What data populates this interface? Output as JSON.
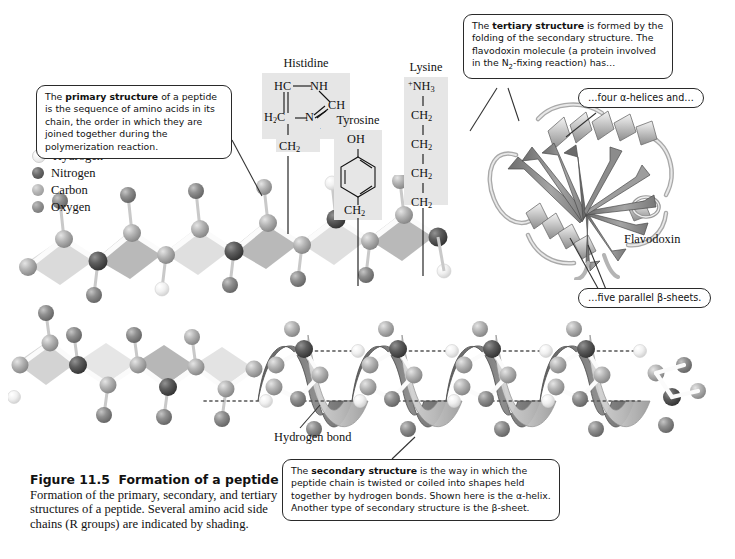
{
  "figure": {
    "number": "Figure 11.5",
    "title": "Formation of a peptide",
    "caption": "Formation of the primary, secondary, and tertiary structures of a peptide. Several amino acid side chains (R groups) are indicated by shading."
  },
  "legend": {
    "items": [
      {
        "label": "Hydrogen",
        "color": "#eeeeee",
        "key": "H"
      },
      {
        "label": "Nitrogen",
        "color": "#555555",
        "key": "N"
      },
      {
        "label": "Carbon",
        "color": "#b0b0b0",
        "key": "C"
      },
      {
        "label": "Oxygen",
        "color": "#8a8a8a",
        "key": "O"
      }
    ]
  },
  "callouts": {
    "primary": {
      "prefix": "The ",
      "bold": "primary structure",
      "rest": " of a peptide is the sequence of amino acids in its chain, the order in which they are joined together during the polymerization reaction."
    },
    "tertiary": {
      "prefix": "The ",
      "bold": "tertiary structure",
      "rest": " is formed by the folding of the secondary structure. The flavodoxin molecule (a protein involved in the N2-fixing reaction) has…"
    },
    "secondary": {
      "prefix": "The ",
      "bold": "secondary structure",
      "rest": " is the way in which the peptide chain is twisted or coiled into shapes held together by hydrogen bonds. Shown here is the α-helix. Another type of secondary structure is the β-sheet."
    },
    "helices": "…four α-helices and…",
    "sheets": "…five parallel β-sheets."
  },
  "labels": {
    "flavodoxin": "Flavodoxin",
    "hydrogen_bond": "Hydrogen bond"
  },
  "sidechains": {
    "histidine": {
      "name": "Histidine",
      "atoms": [
        "HC",
        "NH",
        "CH",
        "H2C",
        "N",
        "H+",
        "CH2"
      ]
    },
    "tyrosine": {
      "name": "Tyrosine",
      "atoms": [
        "OH",
        "CH2"
      ]
    },
    "lysine": {
      "name": "Lysine",
      "atoms": [
        "+NH3",
        "CH2",
        "CH2",
        "CH2",
        "CH2"
      ]
    }
  },
  "structures": {
    "primary_chain": "ball-and-stick peptide backbone",
    "alpha_helix": "alpha-helix ball-and-stick with ribbon",
    "flavodoxin_ribbon": "flavodoxin ribbon diagram"
  }
}
